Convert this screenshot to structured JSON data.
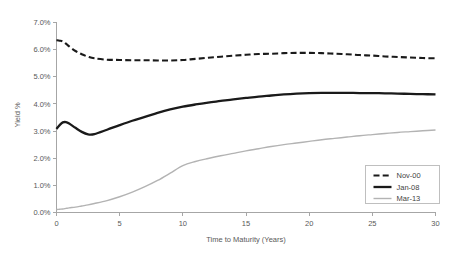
{
  "chart_data": {
    "type": "line",
    "title": "",
    "xlabel": "Time to Maturity (Years)",
    "ylabel": "Yield %",
    "xlim": [
      0,
      30
    ],
    "ylim": [
      0,
      7
    ],
    "xticks": [
      0,
      5,
      10,
      15,
      20,
      25,
      30
    ],
    "xtick_labels": [
      "0",
      "5",
      "10",
      "15",
      "20",
      "25",
      "30"
    ],
    "yticks": [
      0,
      1,
      2,
      3,
      4,
      5,
      6,
      7
    ],
    "ytick_labels": [
      "0.0%",
      "1.0%",
      "2.0%",
      "3.0%",
      "4.0%",
      "5.0%",
      "6.0%",
      "7.0%"
    ],
    "grid": false,
    "legend_position": "bottom-right",
    "x": [
      0,
      0.25,
      0.5,
      0.75,
      1,
      1.5,
      2,
      2.5,
      3,
      4,
      5,
      6,
      7,
      8,
      9,
      10,
      11,
      12,
      13,
      14,
      15,
      16,
      17,
      18,
      19,
      20,
      21,
      22,
      23,
      24,
      25,
      26,
      27,
      28,
      29,
      30
    ],
    "series": [
      {
        "name": "Nov-00",
        "style": "dashed",
        "color": "#1a1a1a",
        "width": 2.1,
        "values": [
          6.35,
          6.33,
          6.3,
          6.22,
          6.12,
          5.95,
          5.83,
          5.74,
          5.68,
          5.63,
          5.62,
          5.61,
          5.61,
          5.6,
          5.6,
          5.62,
          5.66,
          5.7,
          5.74,
          5.78,
          5.81,
          5.84,
          5.85,
          5.87,
          5.88,
          5.88,
          5.87,
          5.85,
          5.83,
          5.8,
          5.78,
          5.75,
          5.73,
          5.71,
          5.69,
          5.68
        ]
      },
      {
        "name": "Jan-08",
        "style": "solid",
        "color": "#1a1a1a",
        "width": 2.3,
        "values": [
          3.08,
          3.22,
          3.32,
          3.33,
          3.28,
          3.12,
          2.97,
          2.88,
          2.89,
          3.05,
          3.22,
          3.38,
          3.52,
          3.67,
          3.8,
          3.9,
          3.98,
          4.05,
          4.11,
          4.17,
          4.22,
          4.27,
          4.31,
          4.35,
          4.38,
          4.4,
          4.41,
          4.41,
          4.41,
          4.4,
          4.4,
          4.39,
          4.38,
          4.37,
          4.36,
          4.35
        ]
      },
      {
        "name": "Mar-13",
        "style": "solid",
        "color": "#b3b3b3",
        "width": 1.4,
        "values": [
          0.11,
          0.12,
          0.13,
          0.15,
          0.17,
          0.2,
          0.24,
          0.28,
          0.33,
          0.44,
          0.58,
          0.75,
          0.95,
          1.18,
          1.45,
          1.73,
          1.88,
          1.99,
          2.09,
          2.18,
          2.27,
          2.35,
          2.43,
          2.5,
          2.56,
          2.62,
          2.68,
          2.73,
          2.78,
          2.83,
          2.87,
          2.91,
          2.95,
          2.98,
          3.01,
          3.04
        ]
      }
    ],
    "legend": [
      {
        "label": "Nov-00",
        "style": "dashed",
        "color": "#1a1a1a"
      },
      {
        "label": "Jan-08",
        "style": "solid",
        "color": "#1a1a1a"
      },
      {
        "label": "Mar-13",
        "style": "solid",
        "color": "#b3b3b3"
      }
    ]
  },
  "colors": {
    "axis": "#a6a6a6",
    "tick_text": "#595959",
    "legend_border": "#bfbfbf",
    "background": "#ffffff"
  }
}
